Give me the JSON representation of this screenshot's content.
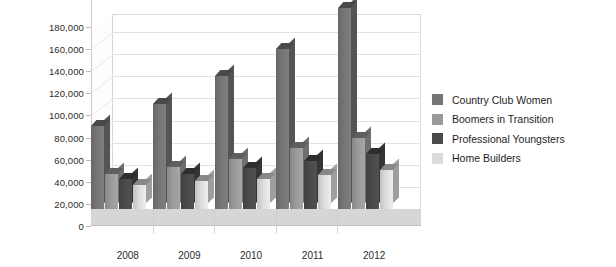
{
  "chart_data": {
    "type": "bar",
    "title": "",
    "subtitle": "",
    "xlabel": "",
    "ylabel": "",
    "categories": [
      "2008",
      "2009",
      "2010",
      "2011",
      "2012"
    ],
    "series": [
      {
        "name": "Country Club Women",
        "color": "#757575",
        "values": [
          75000,
          95000,
          120000,
          145000,
          182000
        ]
      },
      {
        "name": "Boomers in Transition",
        "color": "#9a9a9a",
        "values": [
          32000,
          38000,
          45000,
          55000,
          64000
        ]
      },
      {
        "name": "Professional Youngsters",
        "color": "#4a4a4a",
        "values": [
          27000,
          32000,
          37000,
          43000,
          50000
        ]
      },
      {
        "name": "Home Builders",
        "color": "#dcdcdc",
        "values": [
          22000,
          25000,
          27000,
          31000,
          35000
        ]
      }
    ],
    "ylim": [
      0,
      180000
    ],
    "ytick_values": [
      0,
      20000,
      40000,
      60000,
      80000,
      100000,
      120000,
      140000,
      160000,
      180000
    ],
    "ytick_labels": [
      "0",
      "20,000",
      "40,000",
      "60,000",
      "80,000",
      "100,000",
      "120,000",
      "140,000",
      "160,000",
      "180,000"
    ],
    "grid": true,
    "legend_position": "right",
    "three_d": true,
    "background_color": "#ffffff",
    "gridline_color": "#e2e2e2",
    "floor_color": "#d6d6d6"
  },
  "legend": {
    "items": [
      {
        "label": "Country Club Women"
      },
      {
        "label": "Boomers in Transition"
      },
      {
        "label": "Professional Youngsters"
      },
      {
        "label": "Home Builders"
      }
    ]
  }
}
